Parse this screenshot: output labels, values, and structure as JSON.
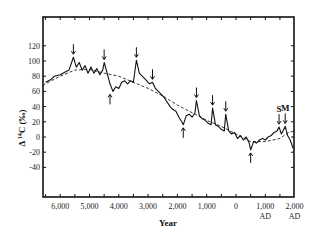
{
  "chart_data": {
    "type": "line",
    "title": "",
    "xlabel": "Year",
    "ylabel": "Δ 14C (‰)",
    "xlim": [
      -6600,
      2000
    ],
    "ylim": [
      -60,
      140
    ],
    "grid": false,
    "legend": null,
    "x_ticks": [
      {
        "value": -6000,
        "label": "6,000"
      },
      {
        "value": -5000,
        "label": "5,000"
      },
      {
        "value": -4000,
        "label": "4,000"
      },
      {
        "value": -3000,
        "label": "3,000"
      },
      {
        "value": -2000,
        "label": "2,000"
      },
      {
        "value": -1000,
        "label": "1,000"
      },
      {
        "value": 0,
        "label": "0"
      },
      {
        "value": 1000,
        "label": "1,000",
        "sublabel": "AD"
      },
      {
        "value": 2000,
        "label": "2,000",
        "sublabel": "AD"
      }
    ],
    "y_ticks": [
      {
        "value": 120,
        "label": "120"
      },
      {
        "value": 100,
        "label": "100"
      },
      {
        "value": 80,
        "label": "80"
      },
      {
        "value": 60,
        "label": "60"
      },
      {
        "value": 40,
        "label": "40"
      },
      {
        "value": 20,
        "label": "20"
      },
      {
        "value": 0,
        "label": "0"
      },
      {
        "value": -20,
        "label": "-20"
      },
      {
        "value": -40,
        "label": "-40"
      }
    ],
    "series": [
      {
        "name": "Δ14C measured",
        "style": "solid",
        "x": [
          -6500,
          -6300,
          -6200,
          -6000,
          -5800,
          -5700,
          -5550,
          -5450,
          -5350,
          -5250,
          -5150,
          -5050,
          -4950,
          -4850,
          -4750,
          -4650,
          -4550,
          -4500,
          -4400,
          -4300,
          -4200,
          -4100,
          -4000,
          -3900,
          -3800,
          -3700,
          -3600,
          -3500,
          -3400,
          -3300,
          -3200,
          -3100,
          -3000,
          -2950,
          -2850,
          -2750,
          -2650,
          -2550,
          -2450,
          -2350,
          -2250,
          -2150,
          -2050,
          -1950,
          -1850,
          -1800,
          -1700,
          -1600,
          -1500,
          -1400,
          -1350,
          -1250,
          -1150,
          -1050,
          -950,
          -850,
          -800,
          -700,
          -600,
          -500,
          -400,
          -350,
          -250,
          -150,
          -50,
          50,
          150,
          250,
          350,
          450,
          500,
          600,
          700,
          800,
          900,
          1000,
          1100,
          1200,
          1300,
          1400,
          1470,
          1550,
          1680,
          1760,
          1850,
          1950
        ],
        "y": [
          72,
          76,
          80,
          82,
          86,
          88,
          105,
          92,
          98,
          88,
          94,
          84,
          92,
          84,
          90,
          82,
          88,
          98,
          84,
          70,
          60,
          66,
          64,
          72,
          74,
          70,
          74,
          72,
          101,
          84,
          80,
          76,
          72,
          70,
          72,
          64,
          60,
          56,
          52,
          46,
          40,
          36,
          34,
          26,
          20,
          16,
          28,
          30,
          26,
          32,
          48,
          28,
          24,
          22,
          18,
          16,
          38,
          16,
          14,
          10,
          8,
          30,
          8,
          4,
          6,
          -2,
          2,
          -4,
          0,
          -8,
          -17,
          -6,
          -8,
          -4,
          -2,
          -4,
          0,
          2,
          6,
          8,
          13,
          4,
          14,
          2,
          -4,
          -15
        ]
      },
      {
        "name": "long-term trend",
        "style": "dashed",
        "x": [
          -6600,
          -6000,
          -5500,
          -5000,
          -4500,
          -4000,
          -3500,
          -3000,
          -2500,
          -2000,
          -1500,
          -1000,
          -500,
          0,
          500,
          1000,
          1500,
          1800,
          2000
        ],
        "y": [
          68,
          80,
          88,
          89,
          84,
          80,
          72,
          64,
          54,
          42,
          32,
          22,
          14,
          4,
          -6,
          -6,
          -2,
          6,
          8
        ]
      }
    ],
    "annotations": [
      {
        "type": "arrow-down",
        "x": -5550,
        "y": 105
      },
      {
        "type": "arrow-down",
        "x": -4500,
        "y": 98
      },
      {
        "type": "arrow-up",
        "x": -4300,
        "y": 60
      },
      {
        "type": "arrow-down",
        "x": -3400,
        "y": 101
      },
      {
        "type": "arrow-down",
        "x": -2850,
        "y": 72
      },
      {
        "type": "arrow-up",
        "x": -1800,
        "y": 16
      },
      {
        "type": "arrow-down",
        "x": -1350,
        "y": 48
      },
      {
        "type": "arrow-down",
        "x": -800,
        "y": 38
      },
      {
        "type": "arrow-down",
        "x": -350,
        "y": 30
      },
      {
        "type": "arrow-up",
        "x": 500,
        "y": -17
      },
      {
        "type": "arrow-down",
        "x": 1470,
        "y": 13,
        "label": "S"
      },
      {
        "type": "arrow-down",
        "x": 1680,
        "y": 14,
        "label": "M"
      }
    ]
  },
  "labels": {
    "xlabel": "Year",
    "ylabel_prefix": "Δ ",
    "ylabel_super": "14",
    "ylabel_main": "C (‰)",
    "annot_s": "S",
    "annot_m": "M"
  }
}
